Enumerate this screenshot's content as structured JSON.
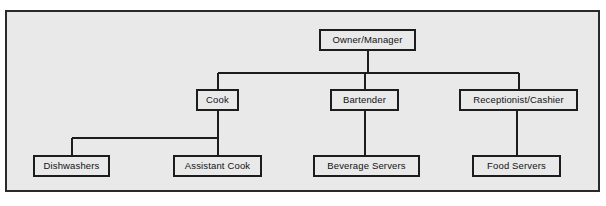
{
  "diagram": {
    "type": "organizational-chart",
    "colors": {
      "page_background": "#ffffff",
      "panel_background": "#e9e9e9",
      "frame_border": "#2a2a2a",
      "box_border": "#1c1c1c",
      "box_fill": "#e9e9e9",
      "connector": "#1c1c1c",
      "text": "#111111"
    },
    "nodes": [
      {
        "id": "owner-manager",
        "label": "Owner/Manager",
        "level": 1,
        "x": 319,
        "y": 29,
        "width": 97,
        "height": 22
      },
      {
        "id": "cook",
        "label": "Cook",
        "level": 2,
        "x": 196,
        "y": 89,
        "width": 43,
        "height": 22
      },
      {
        "id": "bartender",
        "label": "Bartender",
        "level": 2,
        "x": 330,
        "y": 89,
        "width": 69,
        "height": 22
      },
      {
        "id": "receptionist-cashier",
        "label": "Receptionist/Cashier",
        "level": 2,
        "x": 459,
        "y": 89,
        "width": 119,
        "height": 22
      },
      {
        "id": "dishwashers",
        "label": "Dishwashers",
        "level": 3,
        "x": 33,
        "y": 155,
        "width": 77,
        "height": 22
      },
      {
        "id": "assistant-cook",
        "label": "Assistant Cook",
        "level": 3,
        "x": 173,
        "y": 155,
        "width": 89,
        "height": 22
      },
      {
        "id": "beverage-servers",
        "label": "Beverage Servers",
        "level": 3,
        "x": 313,
        "y": 155,
        "width": 107,
        "height": 22
      },
      {
        "id": "food-servers",
        "label": "Food Servers",
        "level": 3,
        "x": 472,
        "y": 155,
        "width": 89,
        "height": 22
      }
    ],
    "edges": [
      {
        "id": "owner-to-cook",
        "from": "owner-manager",
        "to": "cook"
      },
      {
        "id": "owner-to-bartender",
        "from": "owner-manager",
        "to": "bartender"
      },
      {
        "id": "owner-to-receptionist",
        "from": "owner-manager",
        "to": "receptionist-cashier"
      },
      {
        "id": "cook-to-dishwashers",
        "from": "cook",
        "to": "dishwashers"
      },
      {
        "id": "cook-to-assistant-cook",
        "from": "cook",
        "to": "assistant-cook"
      },
      {
        "id": "bartender-to-beverage-servers",
        "from": "bartender",
        "to": "beverage-servers"
      },
      {
        "id": "receptionist-to-food-servers",
        "from": "receptionist-cashier",
        "to": "food-servers"
      }
    ]
  }
}
